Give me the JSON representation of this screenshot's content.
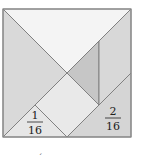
{
  "figure": {
    "type": "tangram-square",
    "pieces": [
      {
        "id": "large-triangle-top",
        "color": "#f4f4f4"
      },
      {
        "id": "large-triangle-left",
        "color": "#d9d9d9"
      },
      {
        "id": "medium-triangle-center",
        "color": "#c6c6c6"
      },
      {
        "id": "parallelogram-right",
        "color": "#d8d8d8"
      },
      {
        "id": "square-center",
        "color": "#e9e9e9"
      },
      {
        "id": "small-triangle-bottom-left",
        "color": "#e6e6e6"
      },
      {
        "id": "triangle-bottom-right",
        "color": "#d5d5d5"
      }
    ],
    "labels": {
      "small_triangle": {
        "numerator": "1",
        "denominator": "16"
      },
      "bottom_right_triangle": {
        "numerator": "2",
        "denominator": "16"
      }
    },
    "stroke_color": "#7a7a7a",
    "footnote_mark": "´"
  }
}
